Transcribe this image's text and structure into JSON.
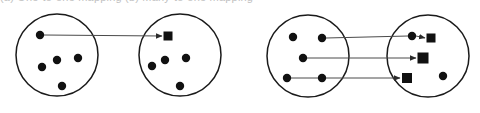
{
  "caption": {
    "clipped_text_top": "(a) One-to-one mapping   (b) Many-to-one mapping"
  },
  "figure": {
    "width": 480,
    "height": 113,
    "background_color": "#ffffff",
    "stroke_color": "#1a1a1a",
    "node_fill_color": "#111111",
    "arrow_color": "#4a4a4a"
  },
  "diagrams": [
    {
      "id": "left-diagram",
      "name": "single-mapping-diagram",
      "sets": [
        {
          "id": "set-a",
          "name": "source-set-left",
          "cx": 57,
          "cy": 55,
          "r": 41,
          "nodes": [
            {
              "id": "a1",
              "type": "dot",
              "cx": 40,
              "cy": 35,
              "r": 4.2
            },
            {
              "id": "a2",
              "type": "dot",
              "cx": 57,
              "cy": 60,
              "r": 4.2
            },
            {
              "id": "a3",
              "type": "dot",
              "cx": 42,
              "cy": 67,
              "r": 4.2
            },
            {
              "id": "a4",
              "type": "dot",
              "cx": 78,
              "cy": 58,
              "r": 4.2
            },
            {
              "id": "a5",
              "type": "dot",
              "cx": 62,
              "cy": 86,
              "r": 4.2
            }
          ]
        },
        {
          "id": "set-b",
          "name": "target-set-left",
          "cx": 180,
          "cy": 55,
          "r": 41,
          "nodes": [
            {
              "id": "b1",
              "type": "square",
              "cx": 168,
              "cy": 36,
              "size": 9
            },
            {
              "id": "b2",
              "type": "dot",
              "cx": 165,
              "cy": 60,
              "r": 4.2
            },
            {
              "id": "b3",
              "type": "dot",
              "cx": 186,
              "cy": 58,
              "r": 4.2
            },
            {
              "id": "b4",
              "type": "dot",
              "cx": 152,
              "cy": 66,
              "r": 4.2
            },
            {
              "id": "b5",
              "type": "dot",
              "cx": 180,
              "cy": 86,
              "r": 4.2
            }
          ]
        }
      ],
      "arrows": [
        {
          "id": "arrow-1",
          "name": "mapping-arrow-1",
          "x1": 44,
          "y1": 35,
          "x2": 162,
          "y2": 36
        }
      ]
    },
    {
      "id": "right-diagram",
      "name": "multi-mapping-diagram",
      "sets": [
        {
          "id": "set-c",
          "name": "source-set-right",
          "cx": 308,
          "cy": 56,
          "r": 41,
          "nodes": [
            {
              "id": "c1",
              "type": "dot",
              "cx": 293,
              "cy": 37,
              "r": 4.2
            },
            {
              "id": "c2",
              "type": "dot",
              "cx": 322,
              "cy": 38,
              "r": 4.2
            },
            {
              "id": "c3",
              "type": "dot",
              "cx": 303,
              "cy": 58,
              "r": 4.2
            },
            {
              "id": "c4",
              "type": "dot",
              "cx": 287,
              "cy": 78,
              "r": 4.2
            },
            {
              "id": "c5",
              "type": "dot",
              "cx": 322,
              "cy": 78,
              "r": 4.2
            }
          ]
        },
        {
          "id": "set-d",
          "name": "target-set-right",
          "cx": 428,
          "cy": 56,
          "r": 41,
          "nodes": [
            {
              "id": "d1",
              "type": "dot",
              "cx": 412,
              "cy": 36,
              "r": 4.2
            },
            {
              "id": "d2",
              "type": "square",
              "cx": 431,
              "cy": 38,
              "size": 9
            },
            {
              "id": "d3",
              "type": "square",
              "cx": 423,
              "cy": 58,
              "size": 11
            },
            {
              "id": "d4",
              "type": "square",
              "cx": 407,
              "cy": 78,
              "size": 10
            },
            {
              "id": "d5",
              "type": "dot",
              "cx": 443,
              "cy": 76,
              "r": 4.2
            }
          ]
        }
      ],
      "arrows": [
        {
          "id": "arrow-2",
          "name": "mapping-arrow-top",
          "x1": 326,
          "y1": 38,
          "x2": 408,
          "y2": 36
        },
        {
          "id": "arrow-3",
          "name": "mapping-arrow-inner-top",
          "x1": 416,
          "y1": 36,
          "x2": 425,
          "y2": 38
        },
        {
          "id": "arrow-4",
          "name": "mapping-arrow-middle",
          "x1": 307,
          "y1": 58,
          "x2": 416,
          "y2": 58
        },
        {
          "id": "arrow-5",
          "name": "mapping-arrow-bottom-link",
          "x1": 291,
          "y1": 78,
          "x2": 318,
          "y2": 78
        },
        {
          "id": "arrow-6",
          "name": "mapping-arrow-bottom",
          "x1": 326,
          "y1": 78,
          "x2": 400,
          "y2": 78
        }
      ]
    }
  ]
}
